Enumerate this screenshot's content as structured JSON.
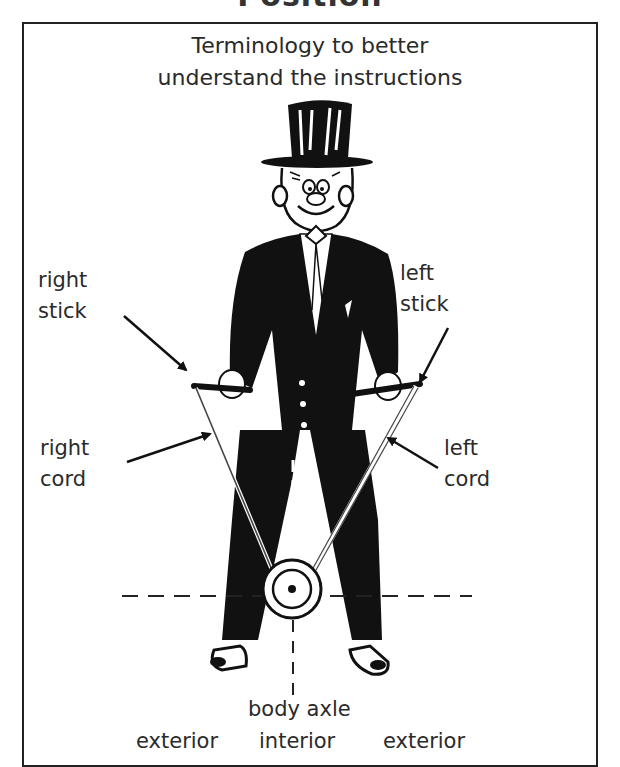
{
  "page": {
    "title_clipped": "Position"
  },
  "diagram": {
    "heading_line1": "Terminology to better",
    "heading_line2": "understand the instructions",
    "labels": {
      "right_stick": [
        "right",
        "stick"
      ],
      "left_stick": [
        "left",
        "stick"
      ],
      "right_cord": [
        "right",
        "cord"
      ],
      "left_cord": [
        "left",
        "cord"
      ],
      "body_axle": "body axle",
      "exterior_left": "exterior",
      "interior": "interior",
      "exterior_right": "exterior"
    },
    "colors": {
      "ink": "#111111",
      "text": "#2a2a2a",
      "background": "#ffffff"
    }
  }
}
